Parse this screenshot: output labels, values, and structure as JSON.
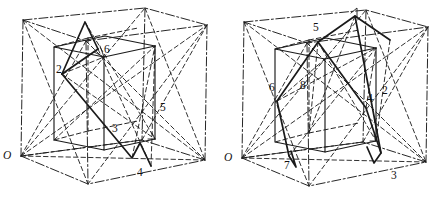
{
  "figure": {
    "type": "line-diagram",
    "width": 442,
    "height": 201,
    "background": "#ffffff",
    "ink": "#1a1a1a",
    "panels": [
      {
        "id": "left-panel",
        "origin_label": "O",
        "origin_pos": [
          5,
          152
        ],
        "vertex_labels": [
          {
            "text": "2",
            "x": 58,
            "y": 70
          },
          {
            "text": "6",
            "x": 106,
            "y": 50
          },
          {
            "text": "3",
            "x": 114,
            "y": 129
          },
          {
            "text": "5",
            "x": 161,
            "y": 108
          },
          {
            "text": "4",
            "x": 138,
            "y": 172
          }
        ],
        "outer_box": {
          "style": "dash-dot",
          "front_bottom_left": [
            21,
            156
          ],
          "front_bottom_right": [
            205,
            160
          ],
          "back_bottom": [
            88,
            184
          ],
          "top_left": [
            23,
            20
          ],
          "top_right": [
            207,
            25
          ]
        },
        "inner_cube": {
          "style": "solid-and-dashed",
          "front_top_left": [
            54,
            47
          ],
          "front_top_right": [
            104,
            57
          ],
          "front_bottom_left": [
            54,
            140
          ],
          "front_bottom_right": [
            104,
            150
          ]
        },
        "polyline_path": {
          "style": "solid-heavy",
          "points": "2-6-3-4-5"
        }
      },
      {
        "id": "right-panel",
        "origin_label": "O",
        "origin_pos": [
          226,
          154
        ],
        "vertex_labels": [
          {
            "text": "5",
            "x": 315,
            "y": 28
          },
          {
            "text": "6",
            "x": 271,
            "y": 88
          },
          {
            "text": "8",
            "x": 301,
            "y": 86
          },
          {
            "text": "4",
            "x": 368,
            "y": 99
          },
          {
            "text": "2",
            "x": 383,
            "y": 91
          },
          {
            "text": "7",
            "x": 285,
            "y": 166
          },
          {
            "text": "3",
            "x": 392,
            "y": 176
          }
        ],
        "outer_box": {
          "style": "dash-dot",
          "front_bottom_left": [
            242,
            158
          ],
          "front_bottom_right": [
            426,
            162
          ],
          "back_bottom": [
            309,
            186
          ],
          "top_left": [
            244,
            22
          ],
          "top_right": [
            428,
            27
          ]
        },
        "inner_cube": {
          "style": "solid-and-dashed",
          "front_top_left": [
            275,
            49
          ],
          "front_top_right": [
            325,
            59
          ],
          "front_bottom_left": [
            275,
            142
          ],
          "front_bottom_right": [
            325,
            152
          ]
        },
        "polyline_path": {
          "style": "solid-heavy",
          "points": "6-5-1-2-4-3-7"
        }
      }
    ],
    "line_styles": {
      "solid": {
        "dasharray": "none",
        "width": 1.1
      },
      "dashed": {
        "dasharray": "5,3",
        "width": 1.0
      },
      "dash_dot": {
        "dasharray": "9,3,2,3",
        "width": 1.0
      },
      "heavy": {
        "dasharray": "none",
        "width": 1.7
      }
    }
  }
}
